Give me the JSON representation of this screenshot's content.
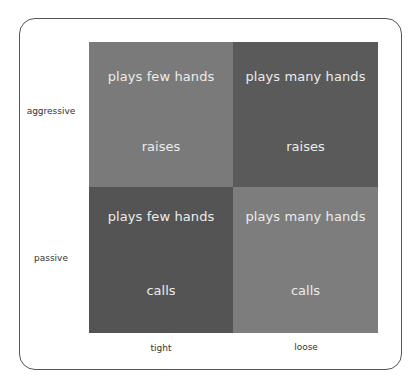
{
  "diagram": {
    "type": "2x2 matrix",
    "row_labels": [
      "aggressive",
      "passive"
    ],
    "column_labels": [
      "tight",
      "loose"
    ],
    "cells": [
      {
        "row": "aggressive",
        "col": "tight",
        "top": "plays few hands",
        "bottom": "raises",
        "color": "#7a7a7a"
      },
      {
        "row": "aggressive",
        "col": "loose",
        "top": "plays many hands",
        "bottom": "raises",
        "color": "#5a5a5a"
      },
      {
        "row": "passive",
        "col": "tight",
        "top": "plays few hands",
        "bottom": "calls",
        "color": "#545454"
      },
      {
        "row": "passive",
        "col": "loose",
        "top": "plays many hands",
        "bottom": "calls",
        "color": "#7d7d7d"
      }
    ],
    "text_color": "#ececec",
    "frame_color": "#555555"
  }
}
